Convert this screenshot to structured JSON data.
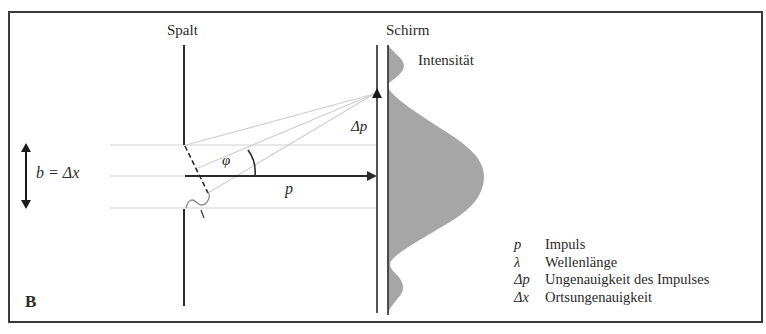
{
  "figure": {
    "panel_label": "B",
    "labels": {
      "slit": "Spalt",
      "screen": "Schirm",
      "intensity": "Intensität",
      "slit_width": "b = Δx",
      "momentum_spread": "Δp",
      "angle": "φ",
      "momentum": "p",
      "wavelength": "λ"
    },
    "legend": [
      {
        "symbol": "p",
        "text": "Impuls"
      },
      {
        "symbol": "λ",
        "text": "Wellenlänge"
      },
      {
        "symbol": "Δp",
        "text": "Ungenauigkeit des Impulses"
      },
      {
        "symbol": "Δx",
        "text": "Ortsungenauigkeit"
      }
    ],
    "colors": {
      "ink": "#2a2a2a",
      "guide_lines": "#d2d2d2",
      "intensity_fill": "#a6a6a6",
      "background": "#ffffff"
    }
  }
}
